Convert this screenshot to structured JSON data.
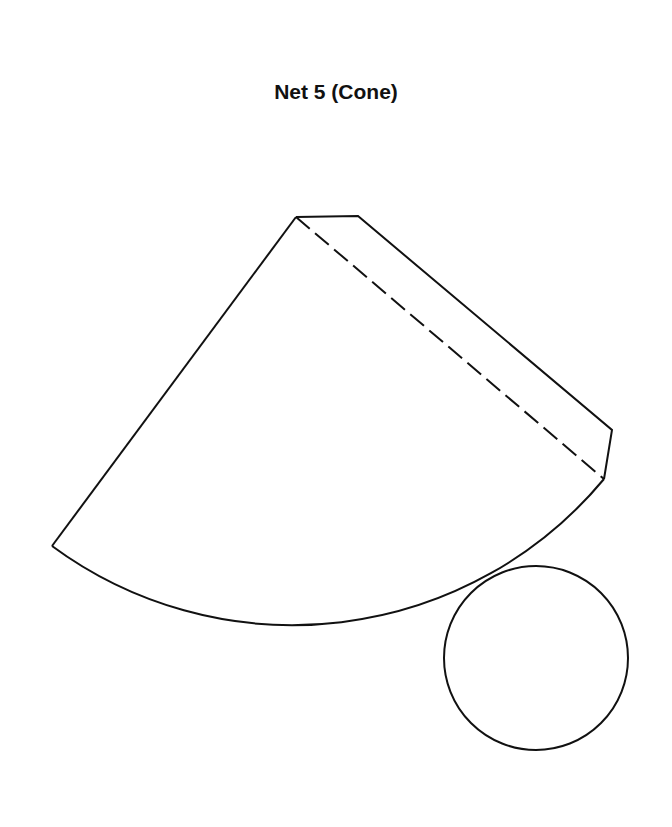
{
  "title": "Net 5 (Cone)",
  "figure": {
    "type": "cone-net",
    "parts": [
      {
        "name": "lateral-surface-sector",
        "shape": "circular sector"
      },
      {
        "name": "glue-tab",
        "shape": "tab along sector edge",
        "fold_line": "dashed"
      },
      {
        "name": "base-circle",
        "shape": "circle"
      }
    ],
    "line_color": "#111111",
    "background": "#ffffff"
  }
}
